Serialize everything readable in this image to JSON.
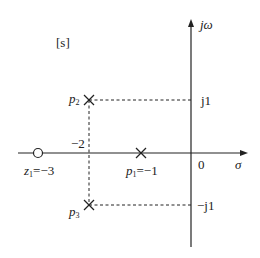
{
  "diagram": {
    "type": "s-plane pole-zero plot",
    "plane_label": "[s]",
    "axes": {
      "real_axis_label": "σ",
      "imag_axis_label": "jω",
      "origin_label": "0",
      "real_tick_label": "−2",
      "imag_tick_upper": "j1",
      "imag_tick_lower": "−j1"
    },
    "zeros": [
      {
        "name": "z1",
        "label_main": "z",
        "label_sub": "1",
        "label_value": "=−3",
        "re": -3,
        "im": 0
      }
    ],
    "poles": [
      {
        "name": "p1",
        "label_main": "p",
        "label_sub": "1",
        "label_value": "=−1",
        "re": -1,
        "im": 0
      },
      {
        "name": "p2",
        "label_main": "p",
        "label_sub": "2",
        "re": -2,
        "im": 1
      },
      {
        "name": "p3",
        "label_main": "p",
        "label_sub": "3",
        "re": -2,
        "im": -1
      }
    ],
    "colors": {
      "line": "#222222",
      "background": "#ffffff"
    }
  }
}
